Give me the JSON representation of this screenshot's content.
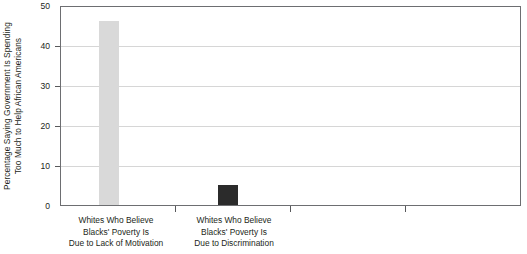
{
  "chart_data": {
    "type": "bar",
    "title": "",
    "xlabel": "",
    "ylabel_lines": [
      "Percentage Saying Government Is Spending",
      "Too Much to Help African Americans"
    ],
    "ylabel": "Percentage Saying Government Is Spending Too Much to Help African Americans",
    "categories": [
      "Whites Who Believe Blacks' Poverty Is Due to Lack of Motivation",
      "Whites Who Believe Blacks' Poverty Is Due to Discrimination"
    ],
    "category_lines": [
      [
        "Whites Who Believe",
        "Blacks' Poverty Is",
        "Due to Lack of Motivation"
      ],
      [
        "Whites Who Believe",
        "Blacks' Poverty Is",
        "Due to Discrimination"
      ]
    ],
    "values": [
      46.5,
      5
    ],
    "bar_colors": [
      "#d9d9d9",
      "#2b2b2b"
    ],
    "ylim": [
      0,
      50
    ],
    "yticks": [
      0,
      10,
      20,
      30,
      40,
      50
    ],
    "ytick_labels": [
      "0",
      "10",
      "20",
      "30",
      "40",
      "50"
    ],
    "grid": true,
    "grid_axis": "y",
    "legend": "none",
    "plot_border": true
  },
  "axis": {
    "tick_0": "0",
    "tick_10": "10",
    "tick_20": "20",
    "tick_30": "30",
    "tick_40": "40",
    "tick_50": "50"
  }
}
